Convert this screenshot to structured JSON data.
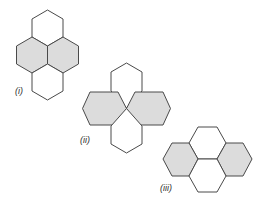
{
  "diagram": {
    "colors": {
      "shaded_fill": "#dcdcdc",
      "plain_fill": "#ffffff",
      "stroke": "#4a4a4a"
    },
    "figures": [
      {
        "id": "figure-i",
        "label": "(i)",
        "shaded_count": 2,
        "plain_count": 2,
        "arrangement": "vertical stack: plain top, two shaded side by side, plain bottom"
      },
      {
        "id": "figure-ii",
        "label": "(ii)",
        "shaded_count": 2,
        "plain_count": 2,
        "arrangement": "cross meeting at a single point: plain top and bottom, shaded left and right"
      },
      {
        "id": "figure-iii",
        "label": "(iii)",
        "shaded_count": 2,
        "plain_count": 2,
        "arrangement": "plain top and bottom stacked in center, shaded left and right"
      }
    ]
  }
}
